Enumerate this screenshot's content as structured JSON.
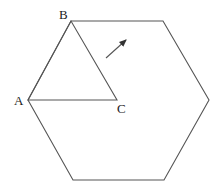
{
  "diagram": {
    "type": "geometry",
    "stroke_color": "#555555",
    "hexagon": {
      "vertices": [
        [
          71,
          21
        ],
        [
          163,
          21
        ],
        [
          209,
          100
        ],
        [
          164,
          180
        ],
        [
          73,
          180
        ],
        [
          28,
          100
        ]
      ]
    },
    "triangle": {
      "vertices": {
        "A": [
          28,
          100
        ],
        "B": [
          71,
          21
        ],
        "C": [
          117,
          100
        ]
      }
    },
    "labels": {
      "A": {
        "text": "A",
        "x": 14,
        "y": 105
      },
      "B": {
        "text": "B",
        "x": 59,
        "y": 19
      },
      "C": {
        "text": "C",
        "x": 117,
        "y": 113
      }
    },
    "arrow": {
      "from": [
        106,
        58
      ],
      "to": [
        126,
        40
      ]
    }
  }
}
